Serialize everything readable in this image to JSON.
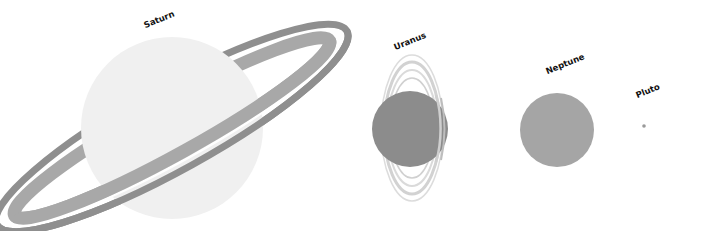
{
  "figure": {
    "background": "#ffffff"
  },
  "planets": [
    {
      "name": "Saturn",
      "label": "Saturn",
      "color": "#f0f0f0",
      "ring_outer": "#8f8f8f",
      "ring_inner": "#a8a8a8",
      "ring_gap": "#ffffff"
    },
    {
      "name": "Uranus",
      "label": "Uranus",
      "color": "#8c8c8c",
      "ring_color": "#d6d6d6"
    },
    {
      "name": "Neptune",
      "label": "Neptune",
      "color": "#a5a5a5"
    },
    {
      "name": "Pluto",
      "label": "Pluto",
      "color": "#9a9a9a"
    }
  ]
}
